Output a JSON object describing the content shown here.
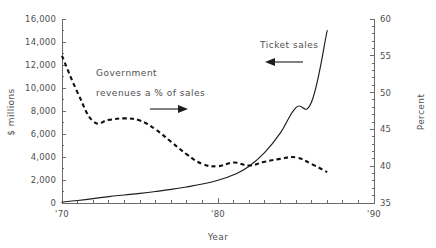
{
  "chart_data": {
    "type": "line",
    "title": "",
    "xlabel": "Year",
    "ylabel": "$ millions",
    "y2label": "Percent",
    "xlim": [
      1970,
      1990
    ],
    "ylim": [
      0,
      16000
    ],
    "y2lim": [
      35,
      60
    ],
    "grid": false,
    "legend": "annotations",
    "x_ticks_major": [
      "'70",
      "'80",
      "'90"
    ],
    "x_tick_values_major": [
      1970,
      1980,
      1990
    ],
    "x_tick_minor_step": 1,
    "y_ticks_left": [
      "0",
      "2,000",
      "4,000",
      "6,000",
      "8,000",
      "10,000",
      "12,000",
      "14,000",
      "16,000"
    ],
    "y_tick_values_left": [
      0,
      2000,
      4000,
      6000,
      8000,
      10000,
      12000,
      14000,
      16000
    ],
    "y_ticks_right": [
      "35",
      "40",
      "45",
      "50",
      "55",
      "60"
    ],
    "y_tick_values_right": [
      35,
      40,
      45,
      50,
      55,
      60
    ],
    "series": [
      {
        "name": "Ticket sales",
        "axis": "left",
        "style": "solid",
        "units": "$ millions",
        "x": [
          1970,
          1971,
          1972,
          1973,
          1974,
          1975,
          1976,
          1977,
          1978,
          1979,
          1980,
          1981,
          1982,
          1983,
          1984,
          1985,
          1986,
          1987
        ],
        "values": [
          80,
          220,
          380,
          560,
          700,
          840,
          1000,
          1180,
          1400,
          1650,
          1980,
          2450,
          3200,
          4400,
          6100,
          8300,
          8800,
          15000
        ]
      },
      {
        "name": "Government revenues a % of sales",
        "axis": "right",
        "style": "dashed",
        "units": "Percent",
        "x": [
          1970,
          1971,
          1972,
          1973,
          1974,
          1975,
          1976,
          1977,
          1978,
          1979,
          1980,
          1981,
          1982,
          1983,
          1984,
          1985,
          1986,
          1987
        ],
        "values": [
          55.0,
          50.0,
          46.1,
          46.3,
          46.5,
          46.2,
          45.0,
          43.3,
          41.6,
          40.3,
          40.0,
          40.5,
          40.1,
          40.6,
          41.0,
          41.2,
          40.3,
          39.2
        ]
      }
    ],
    "annotations": [
      {
        "name": "government-revenues-annotation",
        "line1": "Government",
        "line2": "revenues a % of sales",
        "arrow": "right"
      },
      {
        "name": "ticket-sales-annotation",
        "line1": "Ticket sales",
        "arrow": "left"
      }
    ]
  }
}
